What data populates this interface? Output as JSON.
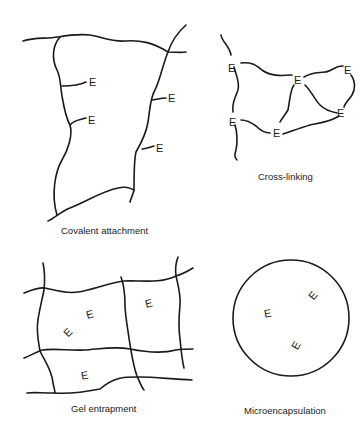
{
  "panels": {
    "covalent": {
      "caption": "Covalent attachment",
      "enzyme_label": "E"
    },
    "crosslinking": {
      "caption": "Cross-linking",
      "enzyme_label": "E"
    },
    "gel": {
      "caption": "Gel entrapment",
      "enzyme_label": "E"
    },
    "micro": {
      "caption": "Microencapsulation",
      "enzyme_label": "E"
    }
  },
  "colors": {
    "line": "#1a1a1a",
    "background": "#ffffff"
  }
}
